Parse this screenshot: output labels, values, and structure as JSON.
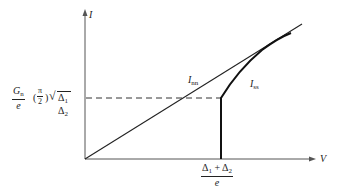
{
  "diagram": {
    "type": "current-voltage characteristic",
    "axes": {
      "y_label": "I",
      "x_label": "V"
    },
    "curves": [
      {
        "name": "normal-normal tunneling",
        "label_main": "I",
        "label_sub": "nn"
      },
      {
        "name": "superconductor-superconductor tunneling",
        "label_main": "I",
        "label_sub": "ss"
      }
    ],
    "y_marker": {
      "frac_num_main": "G",
      "frac_num_sub": "n",
      "frac_den": "e",
      "paren": "(",
      "pi_num": "π",
      "pi_den": "2",
      "paren_close": ")",
      "sqrt_content": "Δ",
      "d1_sub": "1",
      "d2": "Δ",
      "d2_sub": "2"
    },
    "x_marker": {
      "num_a": "Δ",
      "num_a_sub": "1",
      "plus": " + ",
      "num_b": "Δ",
      "num_b_sub": "2",
      "den": "e"
    }
  }
}
